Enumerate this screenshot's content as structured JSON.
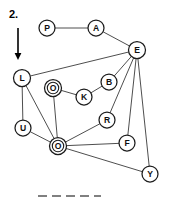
{
  "figure": {
    "step_label": "2.",
    "arrow": {
      "name": "down-arrow",
      "x": 18,
      "y_start": 28,
      "y_end": 60
    },
    "dashed_rule": {
      "x_start": 38,
      "x_end": 101,
      "y": 196,
      "dash_count": 4
    },
    "canvas": {
      "width": 169,
      "height": 206
    },
    "colors": {
      "background": "#ffffff",
      "node_stroke": "#1c1c1c",
      "node_fill": "#ffffff",
      "edge_stroke": "#3a3a3a",
      "label_fill": "#101010",
      "dash_stroke": "#808080"
    }
  },
  "chart_data": {
    "type": "diagram",
    "title": "",
    "graph_kind": "undirected-node-link-graph",
    "nodes": [
      {
        "id": "P",
        "label": "P",
        "x": 47,
        "y": 28,
        "r": 8,
        "double": false
      },
      {
        "id": "A",
        "label": "A",
        "x": 96,
        "y": 28,
        "r": 8,
        "double": false
      },
      {
        "id": "E",
        "label": "E",
        "x": 137,
        "y": 50,
        "r": 8.5,
        "double": false
      },
      {
        "id": "L",
        "label": "L",
        "x": 22,
        "y": 78,
        "r": 8.5,
        "double": false
      },
      {
        "id": "O1",
        "label": "O",
        "x": 53,
        "y": 88,
        "r": 8.5,
        "double": true
      },
      {
        "id": "B",
        "label": "B",
        "x": 109,
        "y": 82,
        "r": 8,
        "double": false
      },
      {
        "id": "K",
        "label": "K",
        "x": 84,
        "y": 97,
        "r": 8,
        "double": false
      },
      {
        "id": "R",
        "label": "R",
        "x": 107,
        "y": 120,
        "r": 8,
        "double": false
      },
      {
        "id": "U",
        "label": "U",
        "x": 23,
        "y": 128,
        "r": 8,
        "double": false
      },
      {
        "id": "O2",
        "label": "O",
        "x": 58,
        "y": 146,
        "r": 8.5,
        "double": true
      },
      {
        "id": "F",
        "label": "F",
        "x": 127,
        "y": 143,
        "r": 8,
        "double": false
      },
      {
        "id": "Y",
        "label": "Y",
        "x": 150,
        "y": 174,
        "r": 8,
        "double": false
      }
    ],
    "edges": [
      {
        "from": "P",
        "to": "A"
      },
      {
        "from": "A",
        "to": "E"
      },
      {
        "from": "E",
        "to": "L"
      },
      {
        "from": "E",
        "to": "B"
      },
      {
        "from": "E",
        "to": "R"
      },
      {
        "from": "E",
        "to": "F"
      },
      {
        "from": "E",
        "to": "Y"
      },
      {
        "from": "B",
        "to": "K"
      },
      {
        "from": "K",
        "to": "O1"
      },
      {
        "from": "O1",
        "to": "O2"
      },
      {
        "from": "L",
        "to": "U"
      },
      {
        "from": "L",
        "to": "O2"
      },
      {
        "from": "U",
        "to": "O2"
      },
      {
        "from": "O2",
        "to": "R"
      },
      {
        "from": "O2",
        "to": "F"
      },
      {
        "from": "O2",
        "to": "Y"
      }
    ],
    "node_count": 12,
    "edge_count": 16
  }
}
